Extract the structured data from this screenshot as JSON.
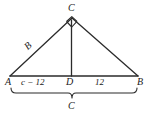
{
  "figure": {
    "type": "geometry-diagram",
    "stroke_color": "#2b2b2b",
    "background_color": "#ffffff",
    "vertices": {
      "A": {
        "label": "A",
        "x": 10,
        "y": 76
      },
      "B": {
        "label": "B",
        "x": 138,
        "y": 76
      },
      "C": {
        "label": "C",
        "x": 72,
        "y": 18
      },
      "D": {
        "label": "D",
        "x": 71,
        "y": 76
      }
    },
    "labels": {
      "left_leg": "B",
      "left_segment": "c − 12",
      "right_segment": "12",
      "base_total": "C"
    },
    "markers": {
      "right_angle_at": "C",
      "brace_from": "A",
      "brace_to": "B"
    }
  }
}
